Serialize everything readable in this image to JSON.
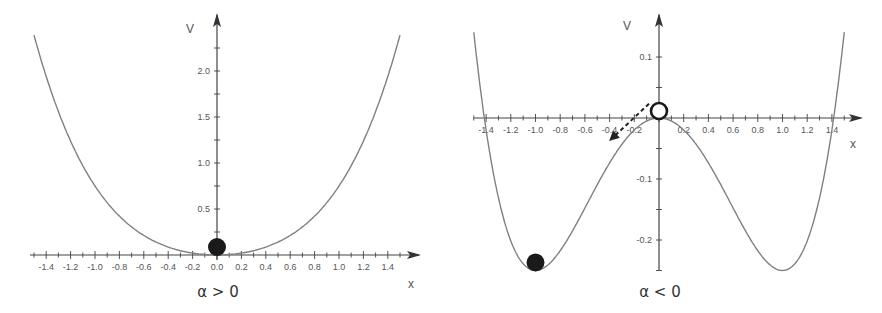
{
  "chart_data": [
    {
      "type": "line",
      "title": "",
      "caption": "α > 0",
      "xlabel": "x",
      "ylabel": "V",
      "function": "V = x^2/2 + x^4/4",
      "xlim": [
        -1.5,
        1.5
      ],
      "ylim": [
        0,
        2.4
      ],
      "x_tick_labels": [
        "-1.4",
        "-1.2",
        "-1.0",
        "-0.8",
        "-0.6",
        "-0.4",
        "-0.2",
        "0.0",
        "0.2",
        "0.4",
        "0.6",
        "0.8",
        "1.0",
        "1.2",
        "1.4"
      ],
      "y_tick_labels": [
        "0.5",
        "1.0",
        "1.5",
        "2.0"
      ],
      "x": [
        -1.5,
        -1.4,
        -1.2,
        -1.0,
        -0.8,
        -0.6,
        -0.4,
        -0.2,
        0.0,
        0.2,
        0.4,
        0.6,
        0.8,
        1.0,
        1.2,
        1.4,
        1.5
      ],
      "values": [
        2.39,
        1.94,
        1.24,
        0.75,
        0.42,
        0.21,
        0.09,
        0.02,
        0.0,
        0.02,
        0.09,
        0.21,
        0.42,
        0.75,
        1.24,
        1.94,
        2.39
      ],
      "grid": false,
      "markers": [
        {
          "name": "ball",
          "style": "filled",
          "x": 0.0,
          "y": 0.0,
          "color": "#1a1a1a"
        }
      ]
    },
    {
      "type": "line",
      "title": "",
      "caption": "α < 0",
      "xlabel": "x",
      "ylabel": "V",
      "function": "V = -x^2/2 + x^4/4",
      "xlim": [
        -1.5,
        1.5
      ],
      "ylim": [
        -0.25,
        0.15
      ],
      "x_tick_labels": [
        "-1.4",
        "-1.2",
        "-1.0",
        "-0.8",
        "-0.6",
        "-0.4",
        "-0.2",
        "0.2",
        "0.4",
        "0.6",
        "0.8",
        "1.0",
        "1.2",
        "1.4"
      ],
      "y_tick_labels": [
        "0.1",
        "-0.1",
        "-0.2"
      ],
      "x": [
        -1.5,
        -1.4,
        -1.2,
        -1.0,
        -0.8,
        -0.6,
        -0.4,
        -0.2,
        0.0,
        0.2,
        0.4,
        0.6,
        0.8,
        1.0,
        1.2,
        1.4,
        1.5
      ],
      "values": [
        0.14,
        -0.02,
        -0.2,
        -0.25,
        -0.22,
        -0.15,
        -0.07,
        -0.02,
        0.0,
        -0.02,
        -0.07,
        -0.15,
        -0.22,
        -0.25,
        -0.2,
        -0.02,
        0.14
      ],
      "grid": false,
      "markers": [
        {
          "name": "unstable-ball",
          "style": "open",
          "x": 0.0,
          "y": 0.0,
          "color": "#1a1a1a"
        },
        {
          "name": "stable-ball",
          "style": "filled",
          "x": -1.0,
          "y": -0.25,
          "color": "#1a1a1a"
        }
      ],
      "annotations": [
        {
          "type": "dashed-arrow",
          "from": [
            0.0,
            0.02
          ],
          "to": [
            -0.38,
            -0.03
          ],
          "meaning": "ball rolls down toward minimum"
        }
      ]
    }
  ],
  "colors": {
    "curve": "#808080",
    "axis": "#444444",
    "ball": "#1a1a1a"
  }
}
